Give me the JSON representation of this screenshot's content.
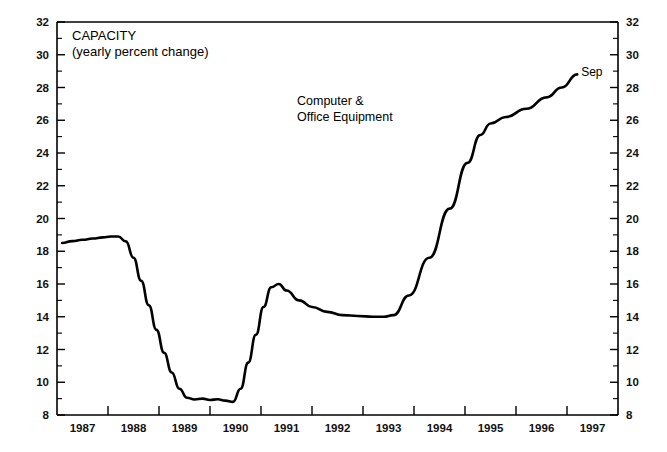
{
  "chart_data": {
    "type": "line",
    "title": "CAPACITY",
    "subtitle": "(yearly percent change)",
    "series_label_line1": "Computer &",
    "series_label_line2": "Office Equipment",
    "endpoint_label": "Sep",
    "xlabel": "",
    "ylabel": "",
    "ylim": [
      8,
      32
    ],
    "xlim": [
      1986.5,
      1997.5
    ],
    "y_major_step": 2,
    "y_minor_step": 1,
    "grid": false,
    "legend_position": "none",
    "line_color": "#000000",
    "background_color": "#ffffff",
    "axis_color": "#000000",
    "y_ticks": [
      8,
      10,
      12,
      14,
      16,
      18,
      20,
      22,
      24,
      26,
      28,
      30,
      32
    ],
    "y_tick_labels": [
      "8",
      "10",
      "12",
      "14",
      "16",
      "18",
      "20",
      "22",
      "24",
      "26",
      "28",
      "30",
      "32"
    ],
    "y_minor_ticks": [
      9,
      11,
      13,
      15,
      17,
      19,
      21,
      23,
      25,
      27,
      29,
      31
    ],
    "x_ticks": [
      1987,
      1988,
      1989,
      1990,
      1991,
      1992,
      1993,
      1994,
      1995,
      1996,
      1997
    ],
    "x_tick_labels": [
      "1987",
      "1988",
      "1989",
      "1990",
      "1991",
      "1992",
      "1993",
      "1994",
      "1995",
      "1996",
      "1997"
    ],
    "x_tick_boundaries": [
      1986.5,
      1987.5,
      1988.5,
      1989.5,
      1990.5,
      1991.5,
      1992.5,
      1993.5,
      1994.5,
      1995.5,
      1996.5,
      1997.5
    ],
    "series": [
      {
        "name": "Computer & Office Equipment",
        "x": [
          1986.6,
          1986.8,
          1987.0,
          1987.2,
          1987.4,
          1987.55,
          1987.7,
          1987.85,
          1988.0,
          1988.15,
          1988.3,
          1988.45,
          1988.6,
          1988.75,
          1988.9,
          1989.05,
          1989.2,
          1989.35,
          1989.5,
          1989.65,
          1989.8,
          1989.95,
          1990.1,
          1990.25,
          1990.4,
          1990.55,
          1990.7,
          1990.85,
          1991.0,
          1991.25,
          1991.5,
          1991.8,
          1992.1,
          1992.4,
          1992.7,
          1992.9,
          1993.1,
          1993.4,
          1993.8,
          1994.2,
          1994.55,
          1994.8,
          1995.0,
          1995.3,
          1995.7,
          1996.1,
          1996.4,
          1996.7
        ],
        "y": [
          18.5,
          18.62,
          18.7,
          18.78,
          18.85,
          18.9,
          18.9,
          18.6,
          17.6,
          16.2,
          14.7,
          13.2,
          11.8,
          10.6,
          9.6,
          9.05,
          8.95,
          9.0,
          8.92,
          8.96,
          8.88,
          8.8,
          9.6,
          11.2,
          12.9,
          14.6,
          15.8,
          16.0,
          15.6,
          15.0,
          14.6,
          14.3,
          14.1,
          14.05,
          14.0,
          14.0,
          14.1,
          15.3,
          17.6,
          20.6,
          23.4,
          25.1,
          25.8,
          26.2,
          26.7,
          27.4,
          28.0,
          28.8
        ]
      }
    ],
    "annotations": [
      {
        "text": "CAPACITY",
        "x": 1987.0,
        "y": 31.2
      },
      {
        "text": "(yearly percent change)",
        "x": 1987.0,
        "y": 30.1
      },
      {
        "text": "Computer &",
        "x": 1991.2,
        "y": 27.8
      },
      {
        "text": "Office Equipment",
        "x": 1991.2,
        "y": 26.7
      },
      {
        "text": "Sep",
        "x": 1996.85,
        "y": 29.0
      }
    ]
  }
}
